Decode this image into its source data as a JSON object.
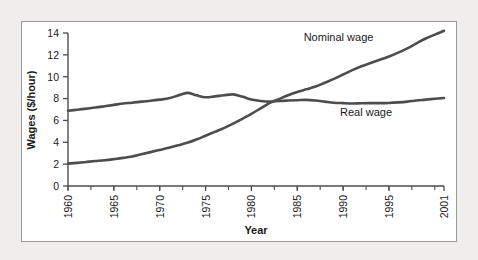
{
  "chart_data": {
    "type": "line",
    "title": "",
    "xlabel": "Year",
    "ylabel": "Wages ($/hour)",
    "xlim": [
      1960,
      2001
    ],
    "ylim": [
      0,
      14
    ],
    "yticks": [
      0,
      2,
      4,
      6,
      8,
      10,
      12,
      14
    ],
    "xticks": [
      1960,
      1965,
      1970,
      1975,
      1980,
      1985,
      1990,
      1995,
      2001
    ],
    "xtick_labels": [
      "1960",
      "1965",
      "1970",
      "1975",
      "1980",
      "1985",
      "1990",
      "1995",
      "2001"
    ],
    "ytick_labels": [
      "0",
      "2",
      "4",
      "6",
      "8",
      "10",
      "12",
      "14"
    ],
    "minor_xtick_interval": 2.5,
    "grid": false,
    "legend": "inline-annotations",
    "line_color": "#4d4d4d",
    "line_width": 2.6,
    "series": [
      {
        "name": "Nominal wage",
        "label_x": 1989.5,
        "label_y": 13.3,
        "x": [
          1960,
          1961,
          1962,
          1963,
          1964,
          1965,
          1966,
          1967,
          1968,
          1969,
          1970,
          1971,
          1972,
          1973,
          1974,
          1975,
          1976,
          1977,
          1978,
          1979,
          1980,
          1981,
          1982,
          1983,
          1984,
          1985,
          1986,
          1987,
          1988,
          1989,
          1990,
          1991,
          1992,
          1993,
          1994,
          1995,
          1996,
          1997,
          1998,
          1999,
          2000,
          2001
        ],
        "values": [
          2.05,
          2.12,
          2.2,
          2.28,
          2.36,
          2.46,
          2.57,
          2.7,
          2.9,
          3.1,
          3.3,
          3.5,
          3.72,
          3.95,
          4.25,
          4.6,
          4.95,
          5.3,
          5.7,
          6.15,
          6.6,
          7.1,
          7.6,
          7.95,
          8.3,
          8.6,
          8.85,
          9.1,
          9.45,
          9.8,
          10.2,
          10.6,
          10.95,
          11.25,
          11.55,
          11.85,
          12.2,
          12.6,
          13.05,
          13.5,
          13.85,
          14.2
        ]
      },
      {
        "name": "Real wage",
        "label_x": 1992.5,
        "label_y": 6.4,
        "x": [
          1960,
          1961,
          1962,
          1963,
          1964,
          1965,
          1966,
          1967,
          1968,
          1969,
          1970,
          1971,
          1972,
          1973,
          1974,
          1975,
          1976,
          1977,
          1978,
          1979,
          1980,
          1981,
          1982,
          1983,
          1984,
          1985,
          1986,
          1987,
          1988,
          1989,
          1990,
          1991,
          1992,
          1993,
          1994,
          1995,
          1996,
          1997,
          1998,
          1999,
          2000,
          2001
        ],
        "values": [
          6.88,
          6.98,
          7.08,
          7.18,
          7.3,
          7.42,
          7.55,
          7.62,
          7.72,
          7.8,
          7.9,
          8.02,
          8.28,
          8.52,
          8.3,
          8.12,
          8.2,
          8.3,
          8.38,
          8.18,
          7.92,
          7.78,
          7.72,
          7.78,
          7.82,
          7.85,
          7.88,
          7.82,
          7.72,
          7.62,
          7.58,
          7.55,
          7.57,
          7.58,
          7.58,
          7.6,
          7.65,
          7.72,
          7.82,
          7.9,
          7.98,
          8.05
        ]
      }
    ]
  },
  "axis": {
    "y_title": "Wages ($/hour)",
    "x_title": "Year"
  }
}
